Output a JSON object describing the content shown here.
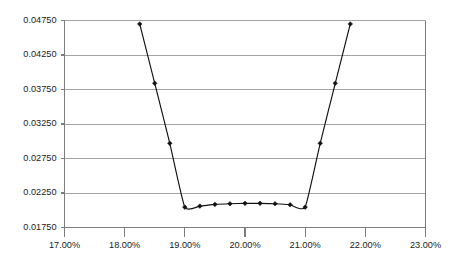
{
  "chart_data": {
    "type": "line",
    "title": "",
    "subtitle": "",
    "xlabel": "",
    "ylabel": "",
    "legend": [],
    "legend_position": "none",
    "grid": {
      "horizontal": true,
      "vertical": false
    },
    "xlim": [
      0.17,
      0.23
    ],
    "ylim": [
      0.0175,
      0.0475
    ],
    "x_tick_labels": [
      "17.00%",
      "18.00%",
      "19.00%",
      "20.00%",
      "21.00%",
      "22.00%",
      "23.00%"
    ],
    "x_tick_values": [
      0.17,
      0.18,
      0.19,
      0.2,
      0.21,
      0.22,
      0.23
    ],
    "y_tick_labels": [
      "0.01750",
      "0.02250",
      "0.02750",
      "0.03250",
      "0.03750",
      "0.04250",
      "0.04750"
    ],
    "y_tick_values": [
      0.0175,
      0.0225,
      0.0275,
      0.0325,
      0.0375,
      0.0425,
      0.0475
    ],
    "series": [
      {
        "name": "series-1",
        "color": "#111111",
        "marker": "diamond",
        "x": [
          0.1825,
          0.185,
          0.1875,
          0.19,
          0.1925,
          0.195,
          0.1975,
          0.2,
          0.2025,
          0.205,
          0.2075,
          0.21,
          0.2125,
          0.215,
          0.2175
        ],
        "y": [
          0.047,
          0.0384,
          0.0297,
          0.02045,
          0.0206,
          0.02085,
          0.02095,
          0.021,
          0.021,
          0.02095,
          0.0208,
          0.02045,
          0.0297,
          0.0384,
          0.047
        ]
      }
    ]
  },
  "axes": {
    "y_axis_name": "y-axis",
    "x_axis_name": "x-axis"
  }
}
